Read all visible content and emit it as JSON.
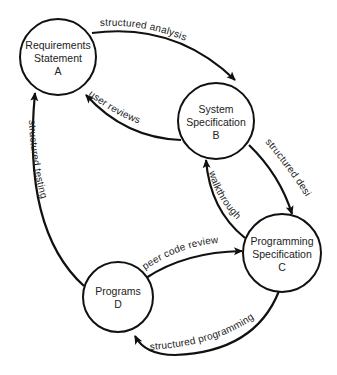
{
  "diagram": {
    "nodes": [
      {
        "id": "A",
        "line1": "Requirements",
        "line2": "Statement",
        "letter": "A"
      },
      {
        "id": "B",
        "line1": "System",
        "line2": "Specification",
        "letter": "B"
      },
      {
        "id": "C",
        "line1": "Programming",
        "line2": "Specification",
        "letter": "C"
      },
      {
        "id": "D",
        "line1": "Programs",
        "line2": "",
        "letter": "D"
      }
    ],
    "edges": [
      {
        "from": "A",
        "to": "B",
        "label": "structured analysis"
      },
      {
        "from": "B",
        "to": "A",
        "label": "user reviews"
      },
      {
        "from": "B",
        "to": "C",
        "label": "structured design"
      },
      {
        "from": "C",
        "to": "B",
        "label": "walkthrough"
      },
      {
        "from": "D",
        "to": "C",
        "label": "peer code review"
      },
      {
        "from": "C",
        "to": "D",
        "label": "structured programming"
      },
      {
        "from": "D",
        "to": "A",
        "label": "structured testing"
      }
    ],
    "colors": {
      "stroke": "#111111",
      "text": "#222222",
      "background": "#ffffff"
    }
  }
}
